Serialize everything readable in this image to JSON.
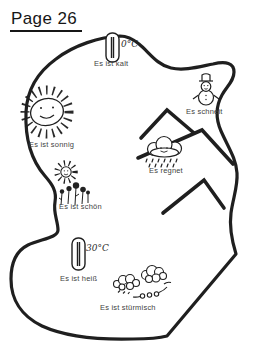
{
  "page_title": "Page 26",
  "island": {
    "items": [
      {
        "id": "kalt",
        "label": "Es ist kalt",
        "icon": "thermometer-cold-icon",
        "value": "0°C"
      },
      {
        "id": "schneit",
        "label": "Es schneit",
        "icon": "snowman-icon"
      },
      {
        "id": "sonnig",
        "label": "Es ist sonnig",
        "icon": "sun-icon"
      },
      {
        "id": "regnet",
        "label": "Es regnet",
        "icon": "rain-cloud-icon"
      },
      {
        "id": "schoen",
        "label": "Es ist schön",
        "icon": "flowers-icon"
      },
      {
        "id": "heiss",
        "label": "Es ist heiß",
        "icon": "thermometer-hot-icon",
        "value": "30°C"
      },
      {
        "id": "stuermisch",
        "label": "Es ist stürmisch",
        "icon": "storm-clouds-icon"
      }
    ],
    "features": [
      "island-outline",
      "mountains"
    ]
  },
  "colors": {
    "ink": "#1f1f1f",
    "background": "#ffffff",
    "text": "#3f3f3f"
  }
}
